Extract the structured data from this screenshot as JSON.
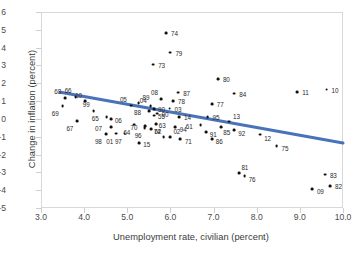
{
  "chart_data": {
    "type": "scatter",
    "title": "",
    "xlabel": "Unemployment rate, civilian (percent)",
    "ylabel": "Change in inflation (percent)",
    "xlim": [
      3.0,
      10.0
    ],
    "ylim": [
      -5,
      6
    ],
    "xticks": [
      "3.0",
      "4.0",
      "5.0",
      "6.0",
      "7.0",
      "8.0",
      "9.0",
      "10.0"
    ],
    "yticks": [
      "6",
      "5",
      "4",
      "3",
      "2",
      "1",
      "0",
      "-1",
      "-2",
      "-3",
      "-4",
      "-5"
    ],
    "grid": false,
    "legend": null,
    "marker_color": "#101010",
    "trendline_color": "#4a72b8",
    "trendline": {
      "x0": 3.45,
      "y0": 1.5,
      "x1": 10.0,
      "y1": -1.35
    },
    "point_label_field": "year",
    "points": [
      {
        "year": "68",
        "x": 3.56,
        "y": 1.15,
        "lx": -4,
        "ly": -7
      },
      {
        "year": "66",
        "x": 3.8,
        "y": 1.22,
        "lx": -4,
        "ly": -7
      },
      {
        "year": "69",
        "x": 3.5,
        "y": 0.72,
        "lx": -4,
        "ly": 7
      },
      {
        "year": "10",
        "x": 4.02,
        "y": 1.02,
        "lx": -3,
        "ly": -6
      },
      {
        "year": "99",
        "x": 4.22,
        "y": 0.42,
        "lx": -4,
        "ly": -7
      },
      {
        "year": "67",
        "x": 3.84,
        "y": -0.12,
        "lx": -4,
        "ly": 7
      },
      {
        "year": "65",
        "x": 4.52,
        "y": 0.08,
        "lx": -8,
        "ly": 1
      },
      {
        "year": "06",
        "x": 4.62,
        "y": -0.02,
        "lx": 4,
        "ly": 1
      },
      {
        "year": "07",
        "x": 4.62,
        "y": -0.45,
        "lx": -9,
        "ly": 1
      },
      {
        "year": "98",
        "x": 4.5,
        "y": -0.85,
        "lx": -4,
        "ly": 7
      },
      {
        "year": "01",
        "x": 4.74,
        "y": -0.82,
        "lx": -3,
        "ly": 7
      },
      {
        "year": "97",
        "x": 4.94,
        "y": -0.82,
        "lx": -3,
        "ly": 7
      },
      {
        "year": "64",
        "x": 5.16,
        "y": -0.32,
        "lx": -4,
        "ly": 7
      },
      {
        "year": "96",
        "x": 5.4,
        "y": -0.52,
        "lx": -3,
        "ly": 7
      },
      {
        "year": "15",
        "x": 5.28,
        "y": -1.38,
        "lx": 4,
        "ly": 1
      },
      {
        "year": "05",
        "x": 5.08,
        "y": 0.75,
        "lx": -4,
        "ly": -7
      },
      {
        "year": "89",
        "x": 5.26,
        "y": 0.88,
        "lx": 4,
        "ly": -6
      },
      {
        "year": "73",
        "x": 5.6,
        "y": 3.05,
        "lx": 5,
        "ly": 0
      },
      {
        "year": "74",
        "x": 5.9,
        "y": 4.82,
        "lx": 5,
        "ly": 0
      },
      {
        "year": "79",
        "x": 6.0,
        "y": 3.72,
        "lx": 5,
        "ly": 0
      },
      {
        "year": "08",
        "x": 5.78,
        "y": 1.12,
        "lx": -3,
        "ly": -7
      },
      {
        "year": "04",
        "x": 5.54,
        "y": 0.72,
        "lx": -4,
        "ly": -6
      },
      {
        "year": "90",
        "x": 5.62,
        "y": 0.55,
        "lx": 4,
        "ly": 0
      },
      {
        "year": "00",
        "x": 5.7,
        "y": 0.3,
        "lx": 4,
        "ly": 0
      },
      {
        "year": "55",
        "x": 5.62,
        "y": 0.18,
        "lx": 4,
        "ly": 0
      },
      {
        "year": "88",
        "x": 5.5,
        "y": 0.42,
        "lx": -8,
        "ly": 1
      },
      {
        "year": "63",
        "x": 5.66,
        "y": -0.28,
        "lx": 3,
        "ly": 1
      },
      {
        "year": "70",
        "x": 5.42,
        "y": -0.42,
        "lx": -8,
        "ly": 1
      },
      {
        "year": "62",
        "x": 5.56,
        "y": -0.58,
        "lx": 3,
        "ly": 2
      },
      {
        "year": "78",
        "x": 6.06,
        "y": 1.02,
        "lx": 5,
        "ly": 0
      },
      {
        "year": "87",
        "x": 6.18,
        "y": 1.48,
        "lx": 5,
        "ly": 0
      },
      {
        "year": "03",
        "x": 5.98,
        "y": 0.58,
        "lx": 5,
        "ly": 0
      },
      {
        "year": "14",
        "x": 6.2,
        "y": 0.12,
        "lx": 5,
        "ly": 0
      },
      {
        "year": "94",
        "x": 6.1,
        "y": -0.48,
        "lx": 5,
        "ly": 2
      },
      {
        "year": "74b",
        "x": 5.84,
        "y": -1.02,
        "lx": -3,
        "ly": -6
      },
      {
        "year": "02",
        "x": 6.0,
        "y": -1.0,
        "lx": 3,
        "ly": -6
      },
      {
        "year": "71",
        "x": 6.22,
        "y": -1.12,
        "lx": 5,
        "ly": 2
      },
      {
        "year": "80",
        "x": 7.1,
        "y": 2.22,
        "lx": 5,
        "ly": 0
      },
      {
        "year": "77",
        "x": 6.96,
        "y": 0.82,
        "lx": 5,
        "ly": 0
      },
      {
        "year": "84",
        "x": 7.48,
        "y": 1.42,
        "lx": 5,
        "ly": 0
      },
      {
        "year": "11",
        "x": 8.94,
        "y": 1.52,
        "lx": 5,
        "ly": 0
      },
      {
        "year": "10b",
        "x": 9.62,
        "y": 1.65,
        "lx": 5,
        "ly": 0
      },
      {
        "year": "95",
        "x": 6.86,
        "y": 0.12,
        "lx": 5,
        "ly": 0
      },
      {
        "year": "13",
        "x": 7.36,
        "y": -0.15,
        "lx": 4,
        "ly": -6
      },
      {
        "year": "85",
        "x": 7.18,
        "y": -0.45,
        "lx": 2,
        "ly": 5
      },
      {
        "year": "92",
        "x": 7.48,
        "y": -0.65,
        "lx": 4,
        "ly": 3
      },
      {
        "year": "61",
        "x": 6.7,
        "y": -0.35,
        "lx": -8,
        "ly": 1
      },
      {
        "year": "91",
        "x": 6.82,
        "y": -0.72,
        "lx": 4,
        "ly": 2
      },
      {
        "year": "86",
        "x": 6.96,
        "y": -1.12,
        "lx": 4,
        "ly": 2
      },
      {
        "year": "12",
        "x": 8.08,
        "y": -0.88,
        "lx": 4,
        "ly": 3
      },
      {
        "year": "75",
        "x": 8.46,
        "y": -1.52,
        "lx": 5,
        "ly": 2
      },
      {
        "year": "81",
        "x": 7.6,
        "y": -3.02,
        "lx": 2,
        "ly": -6
      },
      {
        "year": "76",
        "x": 7.72,
        "y": -3.22,
        "lx": 4,
        "ly": 3
      },
      {
        "year": "83",
        "x": 9.58,
        "y": -3.12,
        "lx": 5,
        "ly": 0
      },
      {
        "year": "09",
        "x": 9.28,
        "y": -3.92,
        "lx": 5,
        "ly": 2
      },
      {
        "year": "82",
        "x": 9.7,
        "y": -3.78,
        "lx": 5,
        "ly": 0
      }
    ]
  }
}
